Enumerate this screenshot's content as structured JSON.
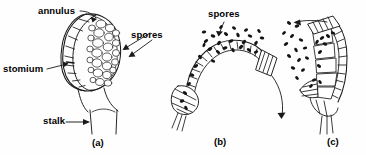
{
  "figure": {
    "background_color": "#fefefe",
    "ink_color": "#1a1a1a",
    "panels": [
      {
        "id": "a",
        "caption": "(a)",
        "stage": "intact sporangium before dehiscence",
        "labels": [
          {
            "key": "annulus",
            "text": "annulus",
            "leader": "curved line to arrowhead at top of annulus"
          },
          {
            "key": "spores",
            "text": "spores",
            "leader": "two arrows pointing left into spore mass"
          },
          {
            "key": "stomium",
            "text": "stomium",
            "leader": "horizontal line to arrowhead at sporangium side"
          },
          {
            "key": "stalk",
            "text": "stalk",
            "leader": "horizontal arrow pointing right at stalk"
          }
        ]
      },
      {
        "id": "b",
        "caption": "(b)",
        "stage": "annulus arched back, spores thrown outward",
        "labels": [
          {
            "key": "spores",
            "text": "spores",
            "leader": "arrow down into scattered spore cloud"
          }
        ],
        "motion_arrow": "curved arrow sweeping down and to the right"
      },
      {
        "id": "c",
        "caption": "(c)",
        "stage": "annulus snaps back, spores ejected",
        "labels": [],
        "motion_arrow": "straight arrow pointing left showing spore ejection"
      }
    ]
  }
}
